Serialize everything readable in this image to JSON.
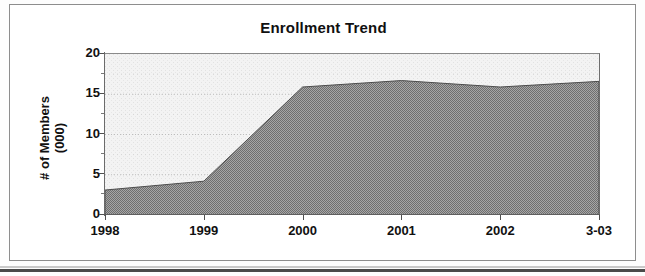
{
  "chart_data": {
    "type": "area",
    "title": "Enrollment Trend",
    "xlabel": "",
    "ylabel": "# of Members\n(000)",
    "categories": [
      "1998",
      "1999",
      "2000",
      "2001",
      "2002",
      "3-03"
    ],
    "values": [
      3.1,
      4.2,
      15.9,
      16.7,
      15.9,
      16.6
    ],
    "series": [
      {
        "name": "Members",
        "values": [
          3.1,
          4.2,
          15.9,
          16.7,
          15.9,
          16.6
        ]
      }
    ],
    "ylim": [
      0,
      20
    ],
    "y_ticks": [
      "0",
      "5",
      "10",
      "15",
      "20"
    ],
    "y_tick_values": [
      0,
      5,
      10,
      15,
      20
    ],
    "y_minor_tick_values": [
      2.5,
      7.5,
      12.5,
      17.5
    ],
    "grid": true,
    "grid_axis": "y",
    "legend": "none",
    "area_fill_color": "#7d7d7d",
    "plot_background_color": "#f2f2f2",
    "axis_color": "#5e5e5e",
    "text_color": "#111111"
  },
  "frame": {
    "border_color": "#8d8d8d",
    "background_color": "#ffffff"
  }
}
